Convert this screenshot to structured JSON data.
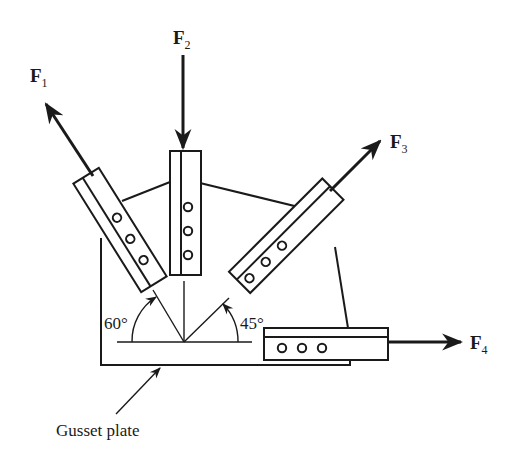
{
  "diagram": {
    "type": "gusset plate free-body diagram",
    "ink_color": "#1a1a1a",
    "background": "#ffffff",
    "forces": [
      {
        "id": "F1",
        "label": "F",
        "subscript": "1",
        "direction": "up-left, 60° from horizontal",
        "member_holes": 3
      },
      {
        "id": "F2",
        "label": "F",
        "subscript": "2",
        "direction": "down (vertical)",
        "member_holes": 3
      },
      {
        "id": "F3",
        "label": "F",
        "subscript": "3",
        "direction": "up-right, 45° from horizontal",
        "member_holes": 3
      },
      {
        "id": "F4",
        "label": "F",
        "subscript": "4",
        "direction": "right (horizontal)",
        "member_holes": 3
      }
    ],
    "angles": [
      {
        "label": "60°",
        "between": "horizontal and F1 line"
      },
      {
        "label": "45°",
        "between": "horizontal and F3 line"
      }
    ],
    "caption": "Gusset plate"
  }
}
